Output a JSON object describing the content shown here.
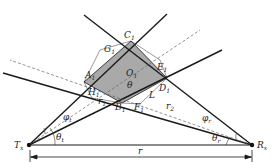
{
  "caption_fragment": "",
  "labels": {
    "C": "C",
    "C_sub": "1",
    "G": "G",
    "G_sub": "1",
    "E": "E",
    "E_sub": "1",
    "A": "A",
    "A_sub": "1",
    "D": "D",
    "D_sub": "1",
    "H": "H",
    "H_sub": "1",
    "B": "B",
    "B_sub": "1",
    "F": "F",
    "F_sub": "1",
    "O": "O",
    "O_sub": "1",
    "theta": "θ",
    "L": "L",
    "r1": "r",
    "r1_sub": "1",
    "r2": "r",
    "r2_sub": "2",
    "phi_t": "φ",
    "phi_t_sub": "t",
    "phi_r": "φ",
    "phi_r_sub": "r",
    "theta_t": "θ",
    "theta_t_sub": "t",
    "theta_r": "θ",
    "theta_r_sub": "r",
    "Tx": "T",
    "Tx_sub": "x",
    "Rx": "R",
    "Rx_sub": "x",
    "r": "r"
  },
  "colors": {
    "shade": "#a9a9a9",
    "line": "#1a1a1a",
    "dash": "#666666"
  }
}
